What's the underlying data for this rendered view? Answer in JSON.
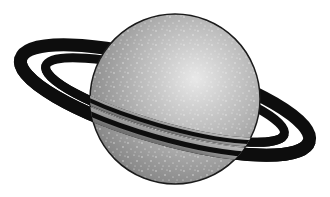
{
  "image": {
    "subject": "ringed planet illustration",
    "width": 330,
    "height": 197,
    "background": "#ffffff"
  },
  "planet": {
    "cx": 175,
    "cy": 99,
    "r": 85,
    "fill_light": "#e6e6e6",
    "fill_mid": "#a8a8a8",
    "fill_dark": "#6e6e6e",
    "outline": "#1a1a1a",
    "speckle_color": "#f2f2f2"
  },
  "rings": {
    "color": "#0d0d0d",
    "gap_color": "#ffffff",
    "rotation_deg": 16
  }
}
